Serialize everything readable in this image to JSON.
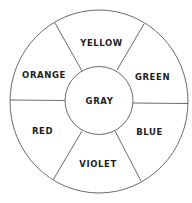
{
  "diagram": {
    "type": "color-wheel",
    "colors": {
      "background": "#ffffff",
      "stroke": "#5a5a5a",
      "text": "#1e1e1e"
    },
    "center": {
      "label": "GRAY",
      "x": 99.5,
      "y": 100.5
    },
    "segments": [
      {
        "label": "YELLOW",
        "x": 101.5,
        "y": 42.5
      },
      {
        "label": "GREEN",
        "x": 152.5,
        "y": 76.5
      },
      {
        "label": "BLUE",
        "x": 149.5,
        "y": 131.5
      },
      {
        "label": "VIOLET",
        "x": 98,
        "y": 163.5
      },
      {
        "label": "RED",
        "x": 42.5,
        "y": 130.5
      },
      {
        "label": "ORANGE",
        "x": 44,
        "y": 74.5
      }
    ]
  }
}
